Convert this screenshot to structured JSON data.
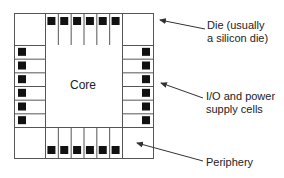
{
  "diagram": {
    "core_label": "Core",
    "labels": {
      "die_line1": "Die (usually",
      "die_line2": "a silicon die)",
      "io_line1": "I/O and power",
      "io_line2": "supply cells",
      "periphery": "Periphery"
    },
    "colors": {
      "stroke": "#555555",
      "pad": "#111111",
      "arrow": "#333333",
      "text": "#222222"
    },
    "layout": {
      "outer": {
        "x": 14,
        "y": 13,
        "w": 139,
        "h": 145
      },
      "core": {
        "x": 45,
        "y": 45,
        "w": 77,
        "h": 82
      },
      "top_cells": 6,
      "bottom_cells": 6,
      "left_cells": 6,
      "right_cells": 6
    }
  }
}
